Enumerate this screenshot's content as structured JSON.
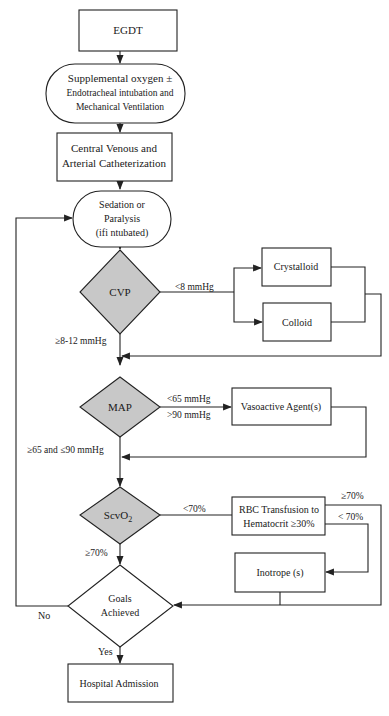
{
  "diagram": {
    "type": "flowchart",
    "colors": {
      "decision_fill": "#c8c8c8",
      "box_fill": "#ffffff",
      "line": "#222222"
    },
    "nodes": {
      "egdt": {
        "label": "EGDT"
      },
      "oxygen": {
        "line1": "Supplemental oxygen ±",
        "line2": "Endotracheal intubation and",
        "line3": "Mechanical Ventilation"
      },
      "catheter": {
        "line1": "Central Venous and",
        "line2": "Arterial Catheterization"
      },
      "sedation": {
        "line1": "Sedation or",
        "line2": "Paralysis",
        "line3": "(ifi ntubated)"
      },
      "cvp": {
        "label": "CVP"
      },
      "crystalloid": {
        "label": "Crystalloid"
      },
      "colloid": {
        "label": "Colloid"
      },
      "map": {
        "label": "MAP"
      },
      "vasoactive": {
        "label": "Vasoactive Agent(s)"
      },
      "scvo2": {
        "label": "ScvO",
        "sub": "2"
      },
      "rbc": {
        "line1": "RBC Transfusion to",
        "line2": "Hematocrit ≥30%"
      },
      "inotrope": {
        "label": "Inotrope (s)"
      },
      "goals": {
        "line1": "Goals",
        "line2": "Achieved"
      },
      "hospital": {
        "label": "Hospital Admission"
      }
    },
    "edge_labels": {
      "cvp_low": "<8 mmHg",
      "cvp_ok": "≥8-12 mmHg",
      "map_low": "<65 mmHg",
      "map_high": ">90 mmHg",
      "map_ok": "≥65 and ≤90 mmHg",
      "scvo2_low": "<70%",
      "scvo2_ok": "≥70%",
      "rbc_ok": "≥70%",
      "rbc_low": "< 70%",
      "goals_no": "No",
      "goals_yes": "Yes"
    }
  }
}
